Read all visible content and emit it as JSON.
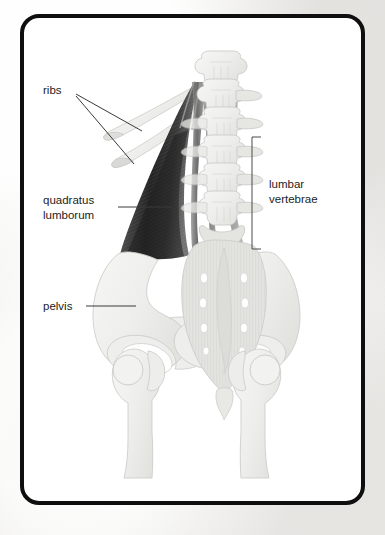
{
  "figure": {
    "kind": "anatomical-illustration",
    "card": {
      "background_color": "#ffffff",
      "border_color": "#100f0f",
      "border_width_px": 4,
      "corner_radius_px": 19
    },
    "page_background_color": "#eeedeb",
    "palette": {
      "bone_fill": "#f0f0ee",
      "bone_outline": "#c9c9c6",
      "bone_shadow": "#e0e0dd",
      "sacrum_fill": "#e3e3e0",
      "muscle_dark": "#232323",
      "muscle_mid": "#6f6f6f",
      "muscle_light": "#b9b9b9",
      "label_text": "#1c1c1c",
      "leader_line": "#3a3a3a",
      "bracket": "#4a4a4a"
    }
  },
  "labels": [
    {
      "id": "ribs",
      "text": "ribs",
      "x": 19,
      "y": 72,
      "anchor": "start",
      "leader_count": 2,
      "points_to": "two lowest ribs (11th and 12th)"
    },
    {
      "id": "quadratus-lumborum",
      "text_line1": "quadratus",
      "text_line2": "lumborum",
      "x": 19,
      "y": 192,
      "anchor": "start",
      "leader_count": 1,
      "points_to": "dark fan-shaped muscle"
    },
    {
      "id": "lumbar-vertebrae",
      "text_line1": "lumbar",
      "text_line2": "vertebrae",
      "x": 245,
      "y": 175,
      "anchor": "start",
      "bracket": {
        "x": 228,
        "top": 119,
        "bottom": 231,
        "arm": 9
      },
      "points_to": "five lumbar vertebrae L1-L5"
    },
    {
      "id": "pelvis",
      "text": "pelvis",
      "x": 19,
      "y": 291,
      "anchor": "start",
      "leader_count": 1,
      "points_to": "left iliac wing"
    }
  ],
  "anatomy": {
    "vertebrae_count": 5,
    "ribs_count": 2,
    "sacral_foramina_pairs": 4,
    "femur_count": 2,
    "structures": [
      "thoracic vertebra T12",
      "lumbar vertebrae L1-L5",
      "11th rib",
      "12th rib",
      "quadratus lumborum",
      "ilium",
      "sacrum",
      "coccyx",
      "pubis",
      "ischium",
      "obturator foramen",
      "femoral head",
      "greater trochanter",
      "femoral shaft"
    ]
  }
}
